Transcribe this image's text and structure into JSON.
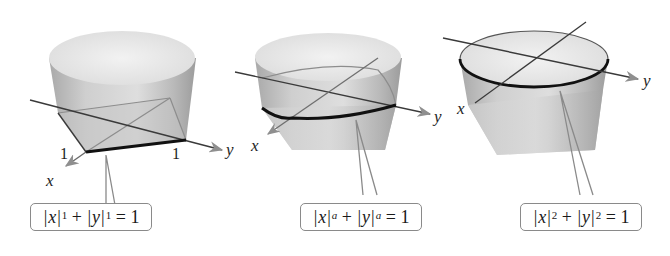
{
  "figures": [
    {
      "id": "p1",
      "exponent": "1",
      "equation": {
        "x_var": "x",
        "y_var": "y",
        "exponent": "1",
        "rhs": "1"
      },
      "equation_text": "|x|^1 + |y|^1 = 1",
      "axis_labels": {
        "x": "x",
        "y": "y"
      },
      "tick_labels": {
        "x_one": "1",
        "y_one": "1"
      },
      "curve_shape": "diamond (square)"
    },
    {
      "id": "pa",
      "exponent": "a",
      "equation": {
        "x_var": "x",
        "y_var": "y",
        "exponent": "a",
        "rhs": "1"
      },
      "equation_text": "|x|^a + |y|^a = 1",
      "axis_labels": {
        "x": "x",
        "y": "y"
      },
      "curve_shape": "superellipse"
    },
    {
      "id": "p2",
      "exponent": "2",
      "equation": {
        "x_var": "x",
        "y_var": "y",
        "exponent": "2",
        "rhs": "1"
      },
      "equation_text": "|x|^2 + |y|^2 = 1",
      "axis_labels": {
        "x": "x",
        "y": "y"
      },
      "curve_shape": "circle"
    }
  ],
  "colors": {
    "surface_light": "#ececec",
    "surface_mid": "#c8c8c8",
    "surface_dark": "#9a9a9a",
    "axis": "#3a3a3a",
    "curve": "#111111",
    "callout_border": "#8a8a8a"
  }
}
